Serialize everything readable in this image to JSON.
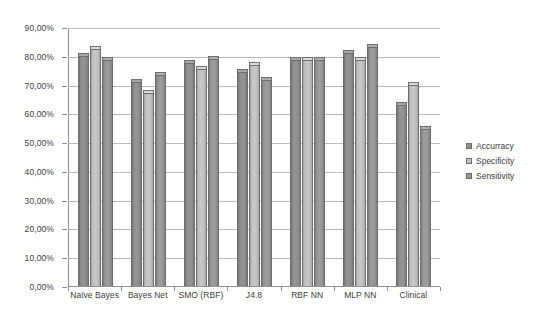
{
  "chart_data": {
    "type": "bar",
    "title": "",
    "subtitle": "",
    "xlabel": "",
    "ylabel": "",
    "ylim": [
      0,
      90
    ],
    "grid": true,
    "legend_position": "right",
    "value_suffix": "%",
    "decimal_separator": ",",
    "categories": [
      "Naïve Bayes",
      "Bayes Net",
      "SMO (RBF)",
      "J4.8",
      "RBF NN",
      "MLP NN",
      "Clinical"
    ],
    "ytick_labels": [
      "90,00%",
      "80,00%",
      "70,00%",
      "60,00%",
      "50,00%",
      "40,00%",
      "30,00%",
      "20,00%",
      "10,00%",
      "0,00%"
    ],
    "ytick_values": [
      90,
      80,
      70,
      60,
      50,
      40,
      30,
      20,
      10,
      0
    ],
    "series": [
      {
        "name": "Accurracy",
        "color": "#8f8f8f",
        "values": [
          81.0,
          72.0,
          78.5,
          75.5,
          79.5,
          82.0,
          64.0
        ]
      },
      {
        "name": "Specificity",
        "color": "#c4c4c4",
        "values": [
          83.5,
          68.0,
          76.5,
          78.0,
          79.5,
          79.5,
          71.0
        ]
      },
      {
        "name": "Sensitivity",
        "color": "#9a9a9a",
        "values": [
          79.5,
          74.5,
          80.0,
          72.5,
          79.5,
          84.0,
          55.5
        ]
      }
    ]
  },
  "legend": {
    "items": [
      {
        "label": "Accurracy"
      },
      {
        "label": "Specificity"
      },
      {
        "label": "Sensitivity"
      }
    ]
  }
}
